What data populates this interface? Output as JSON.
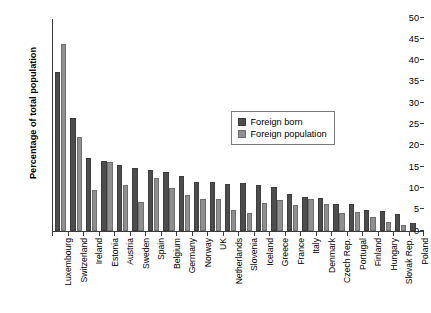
{
  "chart_data": {
    "type": "bar",
    "title": "",
    "xlabel": "",
    "ylabel": "Percentage of total population",
    "ylim": [
      0,
      50
    ],
    "ytick_step": 5,
    "yticks": [
      0,
      5,
      10,
      15,
      20,
      25,
      30,
      35,
      40,
      45,
      50
    ],
    "grid": false,
    "legend_position": "upper-center-right",
    "categories": [
      "Luxembourg",
      "Switzerland",
      "Ireland",
      "Estonia",
      "Austria",
      "Sweden",
      "Spain",
      "Belgium",
      "Germany",
      "Norway",
      "UK",
      "Netherlands",
      "Slovenia",
      "Iceland",
      "Greece",
      "France",
      "Italy",
      "Denmark",
      "Czech Rep.",
      "Portugal",
      "Finland",
      "Hungary",
      "Slovak Rep.",
      "Poland"
    ],
    "series": [
      {
        "name": "Foreign born",
        "color": "#4d4d4d",
        "values": [
          37.3,
          26.6,
          17.2,
          16.4,
          15.6,
          14.7,
          14.4,
          13.8,
          13.0,
          11.5,
          11.4,
          11.0,
          11.2,
          10.9,
          10.3,
          8.6,
          7.9,
          7.8,
          6.4,
          6.3,
          4.9,
          4.8,
          4.1,
          1.8
        ]
      },
      {
        "name": "Foreign population",
        "color": "#8f8f8f",
        "values": [
          44.0,
          22.1,
          9.6,
          16.2,
          10.9,
          6.8,
          12.4,
          10.1,
          8.4,
          7.6,
          7.4,
          4.9,
          4.3,
          6.6,
          7.2,
          6.0,
          7.6,
          6.4,
          4.2,
          4.4,
          3.3,
          2.2,
          1.4,
          null
        ]
      }
    ]
  },
  "legend": {
    "items": [
      {
        "label": "Foreign born"
      },
      {
        "label": "Foreign population"
      }
    ]
  }
}
